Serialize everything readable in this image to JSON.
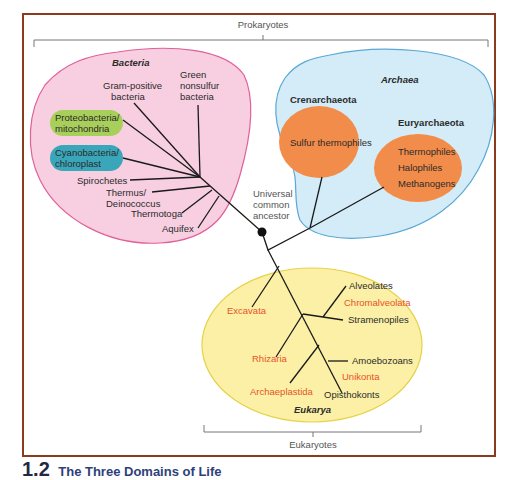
{
  "figure": {
    "number": "1.2",
    "title": "The Three Domains of Life"
  },
  "brackets": {
    "top": "Prokaryotes",
    "bottom": "Eukaryotes"
  },
  "root": {
    "label_lines": [
      "Universal",
      "common",
      "ancestor"
    ]
  },
  "domains": {
    "bacteria": {
      "name": "Bacteria",
      "fill": "#f7cfe0",
      "stroke": "#e0609a",
      "groups": {
        "gram_positive": [
          "Gram-positive",
          "bacteria"
        ],
        "green_nonsulfur": [
          "Green",
          "nonsulfur",
          "bacteria"
        ],
        "proteobacteria": [
          "Proteobacteria/",
          "mitochondria"
        ],
        "cyanobacteria": [
          "Cyanobacteria/",
          "chloroplast"
        ],
        "spirochetes": "Spirochetes",
        "thermus": [
          "Thermus/",
          "Deinococcus"
        ],
        "thermotoga": "Thermotoga",
        "aquifex": "Aquifex"
      },
      "highlight_colors": {
        "proteobacteria": "#a8cf5a",
        "cyanobacteria": "#3aa6b9"
      }
    },
    "archaea": {
      "name": "Archaea",
      "fill": "#d3ecf7",
      "stroke": "#5aa8d6",
      "subgroups": {
        "crenarchaeota": {
          "name": "Crenarchaeota",
          "members": [
            "Sulfur thermophiles"
          ]
        },
        "euryarchaeota": {
          "name": "Euryarchaeota",
          "members": [
            "Thermophiles",
            "Halophiles",
            "Methanogens"
          ]
        }
      },
      "subgroup_fill": "#f28c4a"
    },
    "eukarya": {
      "name": "Eukarya",
      "fill": "#fbf0a6",
      "stroke": "#e6d24a",
      "supergroups": {
        "excavata": "Excavata",
        "chromalveolata": "Chromalveolata",
        "rhizaria": "Rhizaria",
        "unikonta": "Unikonta",
        "archaeplastida": "Archaeplastida"
      },
      "members": {
        "alveolates": "Alveolates",
        "stramenopiles": "Stramenopiles",
        "amoebozoans": "Amoebozoans",
        "opisthokonts": "Opisthokonts"
      },
      "supergroup_color": "#e8532a"
    }
  }
}
